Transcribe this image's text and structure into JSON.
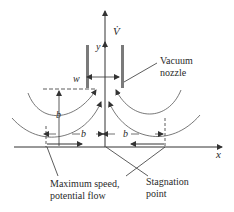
{
  "figure": {
    "type": "vacuum nozzle flow diagram",
    "axes": {
      "x_label": "x",
      "y_label": "y"
    },
    "flow_label": "V̇",
    "nozzle": {
      "label_line1": "Vacuum",
      "label_line2": "nozzle",
      "width_label": "w"
    },
    "dimensions": {
      "height_label": "b",
      "left_span_label": "b",
      "right_span_label": "b"
    },
    "callouts": {
      "max_speed_line1": "Maximum speed,",
      "max_speed_line2": "potential flow",
      "stagnation_line1": "Stagnation",
      "stagnation_line2": "point"
    },
    "colors": {
      "line": "#333333",
      "wall": "#888888"
    }
  }
}
